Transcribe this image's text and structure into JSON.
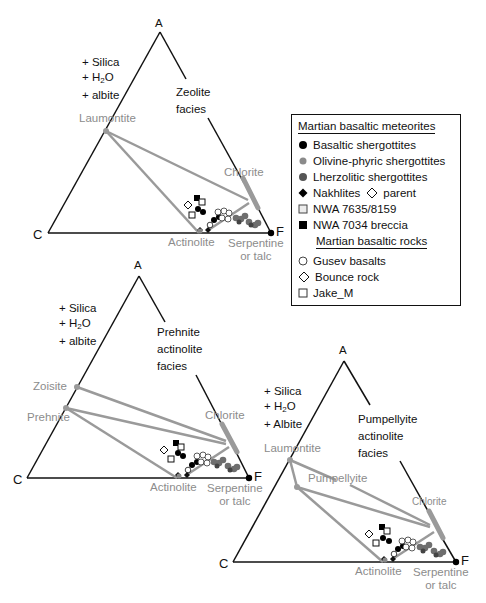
{
  "colors": {
    "axis": "#111111",
    "tieline": "#9a9a9a",
    "mineral_label": "#8c8c8c",
    "basaltic_shergottites": "#000000",
    "olivine_phyric": "#7a7a7a",
    "lherzolitic": "#555555"
  },
  "vertices": {
    "top": "A",
    "left": "C",
    "right": "F"
  },
  "additives": {
    "lower": [
      "+ Silica",
      "+ H",
      "2",
      "O",
      "+ albite"
    ],
    "upper_albite": "+ Albite"
  },
  "diagrams": [
    {
      "id": "zeolite",
      "facies": [
        "Zeolite",
        "facies"
      ],
      "minerals": {
        "laumontite": "Laumontite",
        "chlorite": "Chlorite",
        "actinolite": "Actinolite",
        "serpentine": [
          "Serpentine",
          "or talc"
        ]
      }
    },
    {
      "id": "prehnite-actinolite",
      "facies": [
        "Prehnite",
        "actinolite",
        "facies"
      ],
      "minerals": {
        "zoisite": "Zoisite",
        "prehnite": "Prehnite",
        "chlorite": "Chlorite",
        "actinolite": "Actinolite",
        "serpentine": [
          "Serpentine",
          "or talc"
        ]
      }
    },
    {
      "id": "pumpellyite-actinolite",
      "facies": [
        "Pumpellyite",
        "actinolite",
        "facies"
      ],
      "minerals": {
        "laumontite": "Laumontite",
        "pumpellyite": "Pumpellyite",
        "chlorite": "Chlorite",
        "actinolite": "Actinolite",
        "serpentine": [
          "Serpentine",
          "or talc"
        ]
      }
    }
  ],
  "legend": {
    "group1_title": "Martian basaltic meteorites",
    "group1_items": [
      {
        "symbol": "filled-circle-black",
        "label": "Basaltic shergottites"
      },
      {
        "symbol": "filled-circle-lightgray",
        "label": "Olivine-phyric shergottites"
      },
      {
        "symbol": "filled-circle-darkgray",
        "label": "Lherzolitic shergottites"
      },
      {
        "symbol": "filled-diamond-black",
        "label": "Nakhlites",
        "extra_symbol": "open-diamond",
        "extra_label": "parent"
      },
      {
        "symbol": "open-square-lightfill",
        "label": "NWA 7635/8159"
      },
      {
        "symbol": "filled-square-black",
        "label": "NWA 7034 breccia"
      }
    ],
    "group2_title": "Martian basaltic rocks",
    "group2_items": [
      {
        "symbol": "open-circle",
        "label": "Gusev basalts"
      },
      {
        "symbol": "open-diamond",
        "label": "Bounce rock"
      },
      {
        "symbol": "open-square",
        "label": "Jake_M"
      }
    ]
  }
}
